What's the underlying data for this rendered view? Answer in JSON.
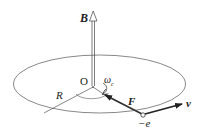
{
  "diagram": {
    "labels": {
      "magnetic_field": "B",
      "origin": "O",
      "angular_frequency": "ω",
      "angular_frequency_sub": "c",
      "radius": "R",
      "force": "F",
      "velocity": "v",
      "charge": "−e"
    },
    "colors": {
      "line": "#444444",
      "ellipse": "#555555",
      "arrow_fill": "#333333"
    }
  }
}
